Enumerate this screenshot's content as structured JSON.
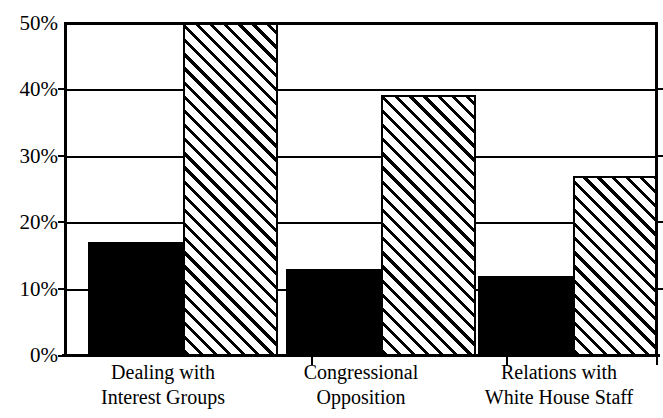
{
  "chart_data": {
    "type": "bar",
    "title": "",
    "subtitle": "",
    "xlabel": "",
    "ylabel": "",
    "ylim": [
      0,
      50
    ],
    "ytick_values": [
      0,
      10,
      20,
      30,
      40,
      50
    ],
    "ytick_labels": [
      "0%",
      "10%",
      "20%",
      "30%",
      "40%",
      "50%"
    ],
    "grid": true,
    "legend": "none",
    "categories": [
      "Dealing with\nInterest Groups",
      "Congressional\nOpposition",
      "Relations with\nWhite House Staff"
    ],
    "category_lines": [
      [
        "Dealing with",
        "Interest Groups"
      ],
      [
        "Congressional",
        "Opposition"
      ],
      [
        "Relations with",
        "White House Staff"
      ]
    ],
    "series": [
      {
        "name": "series-solid",
        "fill": "solid-black",
        "color": "#000000",
        "values": [
          17,
          13,
          12
        ],
        "clipped": [
          false,
          false,
          false
        ]
      },
      {
        "name": "series-hatched",
        "fill": "diagonal-hatch",
        "color": "#000000",
        "values": [
          50,
          39,
          27
        ],
        "clipped": [
          true,
          false,
          false
        ]
      }
    ]
  }
}
